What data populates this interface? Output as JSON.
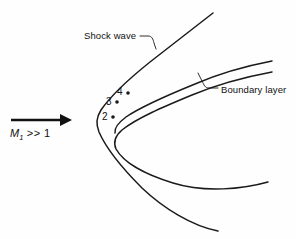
{
  "figure": {
    "name": "hypersonic-blunt-body-shock-layer",
    "background_color": "#fefefe",
    "line_color": "#1a1a1a",
    "width": 296,
    "height": 239
  },
  "annotations": {
    "shock_wave": "Shock wave",
    "boundary_layer": "Boundary layer"
  },
  "stations": [
    {
      "label": "2",
      "dot_x": 113,
      "dot_y": 117
    },
    {
      "label": "3",
      "dot_x": 117,
      "dot_y": 102
    },
    {
      "label": "4",
      "dot_x": 128,
      "dot_y": 93
    }
  ],
  "freestream": {
    "symbol": "M",
    "subscript": "1",
    "relation": ">> 1",
    "arrow_direction": "right"
  }
}
